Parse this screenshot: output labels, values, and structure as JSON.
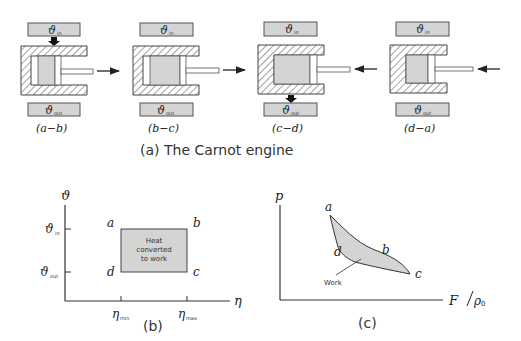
{
  "figure": {
    "caption_a": "(a) The Carnot engine",
    "caption_b": "(b)",
    "caption_c": "(c)"
  },
  "engines": [
    {
      "step": "(a−b)",
      "in_label": "ϑ",
      "in_sub": "in",
      "out_label": "ϑ",
      "out_sub": "out",
      "heat_arrow": "down-from-in",
      "piston_arrow": "right"
    },
    {
      "step": "(b−c)",
      "in_label": "ϑ",
      "in_sub": "in",
      "out_label": "ϑ",
      "out_sub": "out",
      "heat_arrow": "none",
      "piston_arrow": "right"
    },
    {
      "step": "(c−d)",
      "in_label": "ϑ",
      "in_sub": "in",
      "out_label": "ϑ",
      "out_sub": "out",
      "heat_arrow": "down-to-out",
      "piston_arrow": "left"
    },
    {
      "step": "(d−a)",
      "in_label": "ϑ",
      "in_sub": "in",
      "out_label": "ϑ",
      "out_sub": "out",
      "heat_arrow": "none",
      "piston_arrow": "left"
    }
  ],
  "chart_b": {
    "y_axis_label": "ϑ",
    "x_axis_label": "η",
    "y_ticks": [
      {
        "label": "ϑ",
        "sub": "in"
      },
      {
        "label": "ϑ",
        "sub": "out"
      }
    ],
    "x_ticks": [
      {
        "label": "η",
        "sub": "min"
      },
      {
        "label": "η",
        "sub": "max"
      }
    ],
    "corners": {
      "a": "a",
      "b": "b",
      "c": "c",
      "d": "d"
    },
    "rect_text": [
      "Heat",
      "converted",
      "to work"
    ]
  },
  "chart_c": {
    "y_axis_label": "p",
    "x_axis_label": "F",
    "x_axis_denominator": "ρ",
    "x_axis_denominator_sub": "0",
    "points": {
      "a": "a",
      "b": "b",
      "c": "c",
      "d": "d"
    },
    "annotation": "Work"
  },
  "colors": {
    "box_fill": "#d4d4d4",
    "outline": "#444444",
    "hatch": "#555555"
  }
}
